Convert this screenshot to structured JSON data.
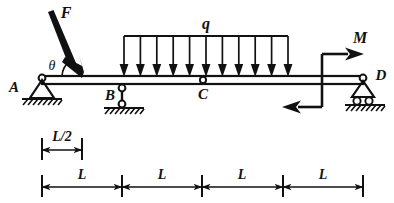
{
  "diagram": {
    "labels": {
      "support_a": "A",
      "support_b": "B",
      "hinge_c": "C",
      "support_d": "D",
      "force_f": "F",
      "angle_theta": "θ",
      "distributed_load": "q",
      "moment_m": "M"
    },
    "dimensions": {
      "half_span": "L/2",
      "span_1": "L",
      "span_2": "L",
      "span_3": "L",
      "span_4": "L"
    },
    "colors": {
      "ink": "#111111",
      "paper": "#ffffff"
    },
    "geometry": {
      "beam_left_x": 42,
      "beam_right_x": 363,
      "beam_top_y": 76,
      "beam_bottom_y": 84,
      "dim_ticks_x": [
        42,
        122,
        202,
        283,
        363
      ],
      "half_span_tick_x": [
        42,
        82
      ],
      "udl_start_x": 124,
      "udl_end_x": 288,
      "udl_arrow_count": 11,
      "udl_top_y": 36,
      "hinge_c_x": 203,
      "support_b_x": 122,
      "moment_x": 322,
      "force_f_tip_x": 82,
      "force_f_tip_y": 77
    }
  }
}
